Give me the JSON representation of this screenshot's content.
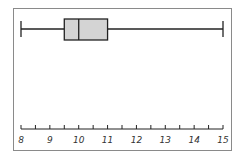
{
  "chart_data": {
    "type": "boxplot",
    "title": "",
    "xlabel": "",
    "ylabel": "",
    "orientation": "horizontal",
    "xlim": [
      8,
      15
    ],
    "ticks": [
      8,
      9,
      10,
      11,
      12,
      13,
      14,
      15
    ],
    "tick_labels": [
      "8",
      "9",
      "10",
      "11",
      "12",
      "13",
      "14",
      "15"
    ],
    "minor_tick_step": 0.5,
    "grid": false,
    "box": {
      "min": 8,
      "q1": 9.5,
      "median": 10,
      "q3": 11,
      "max": 15
    },
    "colors": {
      "box_fill": "#d4d4d4",
      "lines": "#222222",
      "frame": "#8a8a8a"
    }
  }
}
